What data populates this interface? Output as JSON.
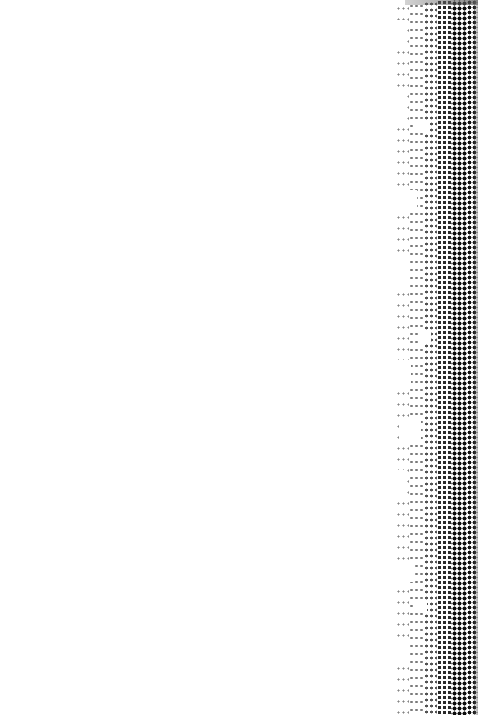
{
  "image": {
    "description": "Mostly blank white page with a vertical black halftone dot strip along the right edge",
    "background_color": "#ffffff",
    "dot_color": "#111111",
    "strip": {
      "x_start": 395,
      "width": 83,
      "dot_pitch_px": 5,
      "density_gradient": "sparse-left to dense-right"
    }
  }
}
